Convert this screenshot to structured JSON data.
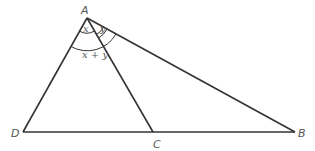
{
  "diagram": {
    "type": "triangle-geometry",
    "points": {
      "A": {
        "label": "A",
        "x": 87,
        "y": 18
      },
      "B": {
        "label": "B",
        "x": 295,
        "y": 132
      },
      "C": {
        "label": "C",
        "x": 153,
        "y": 132
      },
      "D": {
        "label": "D",
        "x": 23,
        "y": 132
      }
    },
    "segments": [
      "AD",
      "AC",
      "AB",
      "DB"
    ],
    "angles": {
      "x": {
        "label": "x",
        "at": "A",
        "between": "AD-AC"
      },
      "y": {
        "label": "y",
        "at": "A",
        "between": "AC-AB"
      },
      "xy": {
        "label": "x + y",
        "at": "A",
        "between": "AD-AB"
      }
    },
    "colors": {
      "line": "#333333",
      "label": "#555555",
      "background": "#ffffff"
    }
  }
}
